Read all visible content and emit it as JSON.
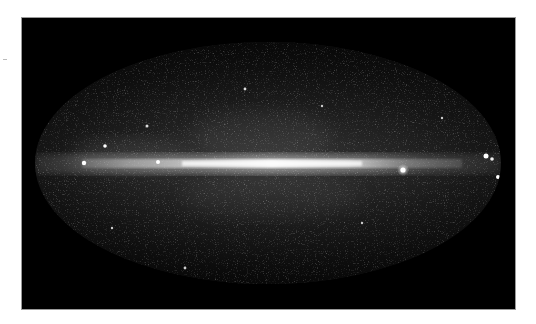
{
  "image": {
    "description": "All-sky map in Mollweide (elliptical) projection showing a bright horizontal galactic plane band across a dark, star-speckled sky",
    "projection": "ellipse",
    "colors": {
      "background": "#000000",
      "sky_base": "#2a2a2a",
      "band": "#e8e8e8",
      "page": "#ffffff"
    },
    "ellipse": {
      "cx": 246,
      "cy": 145,
      "rx": 233,
      "ry": 121
    },
    "band": {
      "y": 146,
      "thickness": 10
    },
    "bright_sources": [
      {
        "x": 62,
        "y": 145,
        "r": 2.2
      },
      {
        "x": 83,
        "y": 128,
        "r": 1.8
      },
      {
        "x": 136,
        "y": 144,
        "r": 2
      },
      {
        "x": 381,
        "y": 152,
        "r": 3
      },
      {
        "x": 464,
        "y": 138,
        "r": 2.5
      },
      {
        "x": 470,
        "y": 141,
        "r": 1.8
      },
      {
        "x": 476,
        "y": 159,
        "r": 2
      },
      {
        "x": 125,
        "y": 108,
        "r": 1.5
      },
      {
        "x": 223,
        "y": 71,
        "r": 1.4
      },
      {
        "x": 163,
        "y": 250,
        "r": 1.4
      }
    ]
  }
}
